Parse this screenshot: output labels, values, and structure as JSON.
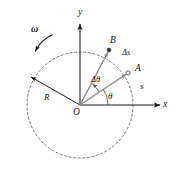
{
  "figure": {
    "background_color": "#ffffff",
    "stroke_dark": "#1a1a1a",
    "stroke_gray": "#8a8a8a",
    "stroke_dashed": "#555555"
  },
  "axes": {
    "x_label": "x",
    "y_label": "y",
    "origin_label": "O"
  },
  "points": {
    "a_label": "A",
    "b_label": "B"
  },
  "vectors": {
    "radius_label": "R",
    "omega_label": "ω"
  },
  "arcs": {
    "theta_label": "θ",
    "delta_theta_label": "Δθ",
    "arc_length_label": "s",
    "delta_s_label": "Δs"
  },
  "icons": {
    "rotation_arrow": "counterclockwise-arrow-icon",
    "x_axis_arrow": "arrow-right-icon",
    "y_axis_arrow": "arrow-up-icon",
    "radius_arrow": "arrow-icon",
    "oa_arrow": "arrow-icon",
    "ob_arrow": "arrow-icon"
  },
  "geometry": {
    "origin_x": 80,
    "origin_y": 105,
    "circle_radius": 53,
    "point_a_x": 128,
    "point_a_y": 73,
    "point_b_x": 109,
    "point_b_y": 50,
    "theta_degrees": 34,
    "delta_theta_degrees": 30
  }
}
